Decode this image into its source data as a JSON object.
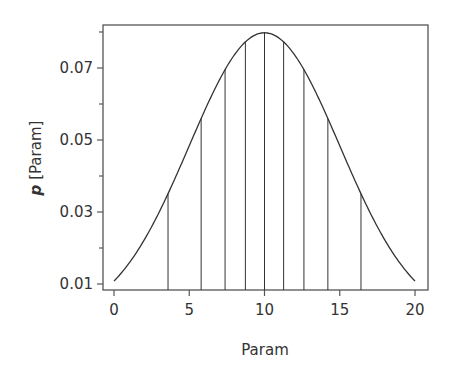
{
  "chart_data": {
    "type": "line",
    "title": "",
    "xlabel": "Param",
    "ylabel_italic": "p",
    "ylabel_rest": " [Param]",
    "ylabel": "p [Param]",
    "xlim": [
      0,
      20
    ],
    "ylim": [
      0.008,
      0.0825
    ],
    "grid": false,
    "legend": null,
    "x_ticks": [
      0,
      5,
      10,
      15,
      20
    ],
    "x_tick_labels": [
      "0",
      "5",
      "10",
      "15",
      "20"
    ],
    "y_ticks": [
      0.01,
      0.03,
      0.05,
      0.07
    ],
    "y_tick_labels": [
      "0.01",
      "0.03",
      "0.05",
      "0.07"
    ],
    "y_minor_ticks": [
      0.02,
      0.04,
      0.06,
      0.08
    ],
    "series": [
      {
        "name": "Normal density (mean 10, sd 5)",
        "mean": 10,
        "sd": 5,
        "x": [
          0,
          1,
          2,
          3,
          4,
          5,
          6,
          7,
          8,
          9,
          10,
          11,
          12,
          13,
          14,
          15,
          16,
          17,
          18,
          19,
          20
        ],
        "values": [
          0.0108,
          0.0155,
          0.0218,
          0.0299,
          0.0333,
          0.0484,
          0.0579,
          0.0666,
          0.0737,
          0.0782,
          0.0798,
          0.0782,
          0.0737,
          0.0666,
          0.0579,
          0.0484,
          0.0389,
          0.0299,
          0.0218,
          0.0155,
          0.0108
        ]
      }
    ],
    "vertical_lines": {
      "description": "Decile boundaries of the distribution",
      "x": [
        3.59,
        5.79,
        7.38,
        8.73,
        10.0,
        11.27,
        12.62,
        14.21,
        16.41
      ]
    }
  },
  "colors": {
    "line": "#333333",
    "axis": "#555555",
    "text": "#333333"
  }
}
